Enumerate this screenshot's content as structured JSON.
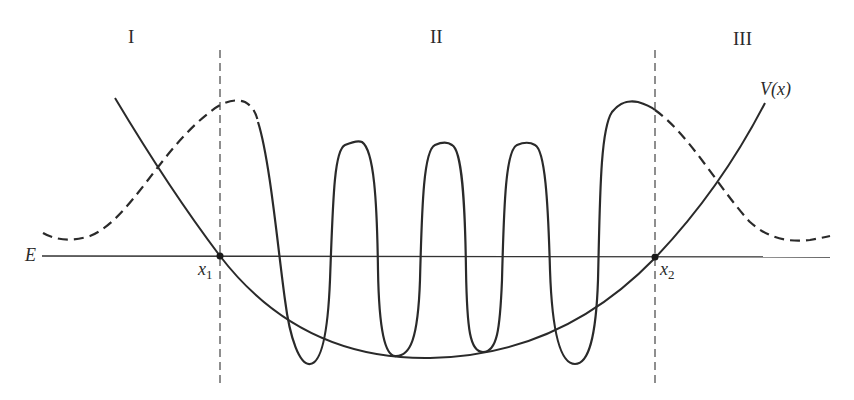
{
  "diagram": {
    "regions": [
      {
        "id": "I",
        "label": "I"
      },
      {
        "id": "II",
        "label": "II"
      },
      {
        "id": "III",
        "label": "III"
      }
    ],
    "curves": {
      "potential_label": "V(x)",
      "energy_label": "E"
    },
    "turning_points": [
      {
        "label": "x",
        "subscript": "1"
      },
      {
        "label": "x",
        "subscript": "2"
      }
    ],
    "colors": {
      "stroke": "#2a2a2a",
      "background": "#ffffff"
    }
  }
}
